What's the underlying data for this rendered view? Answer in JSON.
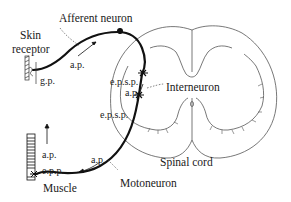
{
  "diagram": {
    "labels": {
      "afferent_neuron": "Afferent neuron",
      "skin_receptor_line1": "Skin",
      "skin_receptor_line2": "receptor",
      "gp": "g.p.",
      "ap_afferent": "a.p.",
      "epsp_upper": "e.p.s.p.",
      "ap_interneuron": "a.p.",
      "interneuron": "Interneuron",
      "epsp_lower": "e.p.s.p.",
      "spinal_cord": "Spinal cord",
      "ap_motor": "a.p.",
      "ap_muscle": "a.p.",
      "epp": "e.p.p.",
      "muscle": "Muscle",
      "motoneuron": "Motoneuron"
    },
    "colors": {
      "ink": "#1a1a1a",
      "outline": "#555555",
      "background": "#ffffff"
    }
  }
}
